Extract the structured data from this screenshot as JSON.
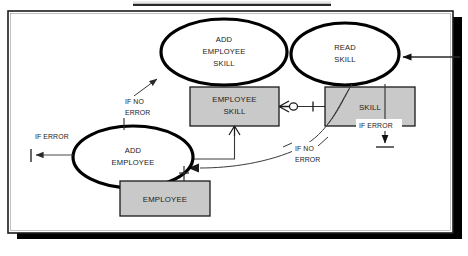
{
  "figure": {
    "type": "entity-process-flow-diagram",
    "frame": {
      "background": "#ffffff",
      "border_color": "#1c1c1c",
      "shadow_color": "#000000"
    },
    "colors": {
      "entity_fill": "#c9c9c9",
      "entity_stroke": "#1a1a1a",
      "process_stroke": "#000000",
      "process_fill": "#ffffff",
      "connector": "#4a4a4a",
      "text": "#1a1a1a"
    }
  },
  "processes": [
    {
      "id": "add-employee-skill",
      "lines": [
        "ADD",
        "EMPLOYEE",
        "SKILL"
      ],
      "cx": 224,
      "cy": 52,
      "rx": 63,
      "ry": 33
    },
    {
      "id": "read-skill",
      "lines": [
        "READ",
        "SKILL"
      ],
      "cx": 345,
      "cy": 54,
      "rx": 54,
      "ry": 31
    },
    {
      "id": "add-employee",
      "lines": [
        "ADD",
        "EMPLOYEE"
      ],
      "cx": 133,
      "cy": 157,
      "rx": 60,
      "ry": 31
    }
  ],
  "entities": [
    {
      "id": "employee-skill",
      "lines": [
        "EMPLOYEE",
        "SKILL"
      ],
      "x": 190,
      "y": 87,
      "w": 89,
      "h": 39
    },
    {
      "id": "skill",
      "lines": [
        "SKILL"
      ],
      "x": 325,
      "y": 87,
      "w": 90,
      "h": 39
    },
    {
      "id": "employee",
      "lines": [
        "EMPLOYEE"
      ],
      "x": 120,
      "y": 181,
      "w": 90,
      "h": 35
    }
  ],
  "flow_labels": [
    {
      "id": "if-no-error-left",
      "lines": [
        "IF NO",
        "ERROR"
      ],
      "x": 125,
      "y": 103
    },
    {
      "id": "if-error-left",
      "lines": [
        "IF ERROR"
      ],
      "x": 35,
      "y": 137
    },
    {
      "id": "if-error-skill",
      "lines": [
        "IF ERROR"
      ],
      "x": 360,
      "y": 127
    },
    {
      "id": "if-no-error-mid",
      "lines": [
        "IF NO",
        "ERROR"
      ],
      "x": 295,
      "y": 150
    }
  ],
  "connectors": [
    {
      "id": "employeeskill-to-skill-relationship",
      "notation": "crowsfoot-optional-to-one"
    },
    {
      "id": "employeeskill-to-addemployee-flow",
      "notation": "crowsfoot"
    },
    {
      "id": "addemployee-to-employee-relationship",
      "notation": "one-to-one-tick"
    },
    {
      "id": "readskill-to-addemployee-flow",
      "notation": "curved-arrow"
    },
    {
      "id": "if-no-error-to-addemployeeskill-arrow",
      "notation": "arrow"
    },
    {
      "id": "addemployee-if-error-out",
      "notation": "arrow-to-bar"
    },
    {
      "id": "skill-if-error-down",
      "notation": "arrow-down-to-bar"
    },
    {
      "id": "external-input-to-readskill",
      "notation": "arrow-from-right-edge"
    }
  ]
}
